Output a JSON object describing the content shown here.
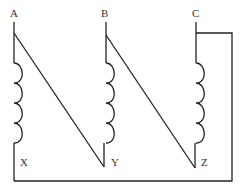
{
  "diagram": {
    "windings": [
      {
        "id": "A-X",
        "start_label": "A",
        "end_label": "X"
      },
      {
        "id": "B-Y",
        "start_label": "B",
        "end_label": "Y"
      },
      {
        "id": "C-Z",
        "start_label": "C",
        "end_label": "Z"
      }
    ],
    "labels": {
      "A": "A",
      "B": "B",
      "C": "C",
      "X": "X",
      "Y": "Y",
      "Z": "Z"
    },
    "connections": [
      {
        "from": "A",
        "to": "Y"
      },
      {
        "from": "B",
        "to": "Z"
      },
      {
        "from": "C",
        "to": "X"
      }
    ],
    "colors": {
      "line": "#222222",
      "label": "#333333",
      "background": "#ffffff"
    }
  }
}
